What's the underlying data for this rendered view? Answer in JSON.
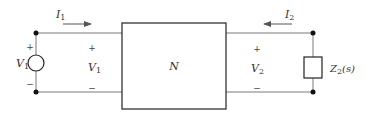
{
  "diagram": {
    "type": "two-port network circuit",
    "network": {
      "label": "N"
    },
    "source": {
      "label": "V",
      "sub": "1",
      "plus": "+",
      "minus": "−"
    },
    "port1": {
      "voltage_label": "V",
      "voltage_sub": "1",
      "plus": "+",
      "minus": "−",
      "current_label": "I",
      "current_sub": "1",
      "current_direction": "right"
    },
    "port2": {
      "voltage_label": "V",
      "voltage_sub": "2",
      "plus": "+",
      "minus": "−",
      "current_label": "I",
      "current_sub": "2",
      "current_direction": "left"
    },
    "load": {
      "label": "Z",
      "sub": "2",
      "suffix": "(s)"
    },
    "colors": {
      "wire": "#7a7a7a",
      "box": "#222222",
      "node": "#111111",
      "text": "#333333"
    }
  }
}
